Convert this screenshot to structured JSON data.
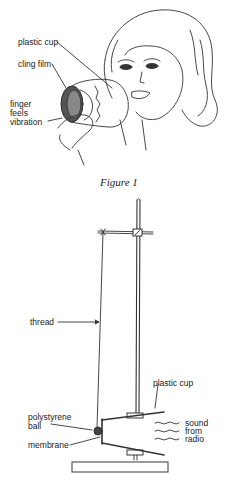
{
  "figure1": {
    "caption": "Figure 1",
    "labels": {
      "plastic_cup": "plastic cup",
      "cling_film": "cling film",
      "finger_line1": "finger",
      "finger_line2": "feels",
      "finger_line3": "vibration"
    }
  },
  "figure2": {
    "labels": {
      "thread": "thread",
      "plastic_cup": "plastic cup",
      "ball_line1": "polystyrene",
      "ball_line2": "ball",
      "membrane": "membrane",
      "sound_line1": "sound",
      "sound_line2": "from",
      "sound_line3": "radio"
    }
  },
  "colors": {
    "ink": "#222222",
    "background": "#ffffff"
  }
}
